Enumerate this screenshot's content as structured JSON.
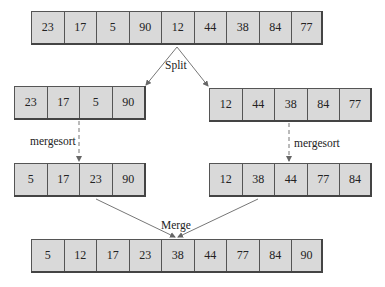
{
  "diagram": {
    "original": [
      "23",
      "17",
      "5",
      "90",
      "12",
      "44",
      "38",
      "84",
      "77"
    ],
    "split_label": "Split",
    "left_half": [
      "23",
      "17",
      "5",
      "90"
    ],
    "right_half": [
      "12",
      "44",
      "38",
      "84",
      "77"
    ],
    "left_recurse_label": "mergesort",
    "right_recurse_label": "mergesort",
    "left_sorted": [
      "5",
      "17",
      "23",
      "90"
    ],
    "right_sorted": [
      "12",
      "38",
      "44",
      "77",
      "84"
    ],
    "merge_label": "Merge",
    "merged": [
      "5",
      "12",
      "17",
      "23",
      "38",
      "44",
      "77",
      "84",
      "90"
    ]
  }
}
